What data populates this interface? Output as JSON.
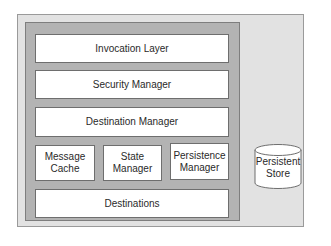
{
  "diagram": {
    "outer_container": "Server Environment",
    "components": {
      "invocation_layer": "Invocation Layer",
      "security_manager": "Security Manager",
      "destination_manager": "Destination Manager",
      "message_cache": [
        "Message",
        "Cache"
      ],
      "state_manager": [
        "State",
        "Manager"
      ],
      "persistence_manager": [
        "Persistence",
        "Manager"
      ],
      "destinations": "Destinations"
    },
    "external": {
      "persistent_store": [
        "Persistent",
        "Store"
      ]
    },
    "colors": {
      "outer_fill": "#e2e2e2",
      "inner_fill": "#b3b3b3",
      "box_fill": "#ffffff",
      "border": "#6e6e6e"
    }
  }
}
